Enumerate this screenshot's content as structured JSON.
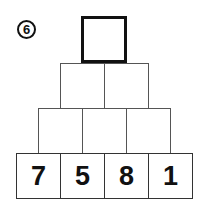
{
  "problem_number": "6",
  "pyramid": {
    "rows": [
      {
        "cells": [
          ""
        ]
      },
      {
        "cells": [
          "",
          ""
        ]
      },
      {
        "cells": [
          "",
          "",
          ""
        ]
      },
      {
        "cells": [
          "7",
          "5",
          "8",
          "1"
        ]
      }
    ]
  }
}
